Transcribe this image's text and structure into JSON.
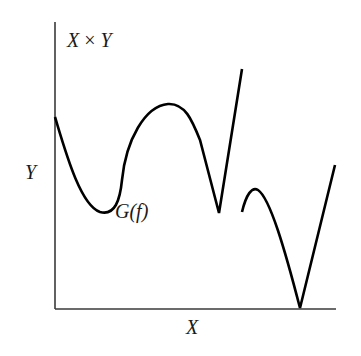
{
  "diagram": {
    "labels": {
      "product_space": "X × Y",
      "product_space_left": "X",
      "product_space_op": "×",
      "product_space_right": "Y",
      "vertical_axis": "Y",
      "horizontal_axis": "X",
      "graph": "G(f)"
    },
    "colors": {
      "background": "#ffffff",
      "axis": "#3a3a3a",
      "curve": "#000000",
      "text": "#1a1a1a"
    },
    "axes": {
      "origin": [
        55,
        309
      ],
      "y_axis_top": [
        55,
        22
      ],
      "x_axis_right": [
        336,
        309
      ]
    },
    "curve_pieces": [
      {
        "name": "first-branch",
        "description": "starts on Y axis, dips to a local minimum, rises to a peak, falls to a cusp, then a straight rising segment ending abruptly",
        "path": "M55,117 C65,150 80,205 100,212 C115,216 120,200 122,180 C126,140 145,106 168,104 C185,103 192,120 200,140 L219,213 L242,69"
      },
      {
        "name": "second-branch",
        "description": "starts after a jump, short rise to a small peak, falls to touch the X axis, then rises linearly",
        "path": "M242,212 C246,195 252,186 258,190 C270,198 285,250 300,308 L335,165"
      }
    ]
  }
}
